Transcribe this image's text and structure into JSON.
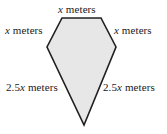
{
  "figure": {
    "shape_name": "kite-pentagon",
    "fill_color": "#e7e7e7",
    "stroke_color": "#231f20",
    "background_color": "#ffffff",
    "stroke_width": 1.6,
    "vertices": [
      {
        "name": "top-left",
        "x": 62,
        "y": 18
      },
      {
        "name": "top-right",
        "x": 101,
        "y": 18
      },
      {
        "name": "right",
        "x": 116,
        "y": 47
      },
      {
        "name": "bottom-apex",
        "x": 84,
        "y": 125
      },
      {
        "name": "left",
        "x": 47,
        "y": 47
      }
    ],
    "labels": {
      "top": {
        "prefix": "",
        "variable": "x",
        "suffix": " meters"
      },
      "upper_left": {
        "prefix": "",
        "variable": "x",
        "suffix": " meters"
      },
      "upper_right": {
        "prefix": "",
        "variable": "x",
        "suffix": " meters"
      },
      "lower_left": {
        "prefix": "2.5",
        "variable": "x",
        "suffix": " meters"
      },
      "lower_right": {
        "prefix": "2.5",
        "variable": "x",
        "suffix": " meters"
      }
    }
  }
}
